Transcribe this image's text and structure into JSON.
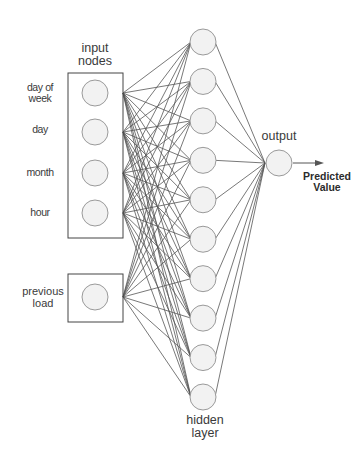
{
  "diagram": {
    "type": "neural-network",
    "labels": {
      "input_header": [
        "input",
        "nodes"
      ],
      "hidden_header": [
        "hidden",
        "layer"
      ],
      "output_header": "output",
      "prediction": [
        "Predicted",
        "Value"
      ]
    },
    "input_nodes": [
      {
        "label": [
          "day of",
          "week"
        ]
      },
      {
        "label": [
          "day"
        ]
      },
      {
        "label": [
          "month"
        ]
      },
      {
        "label": [
          "hour"
        ]
      }
    ],
    "extra_input": {
      "label": [
        "previous",
        "load"
      ]
    },
    "hidden_node_count": 10,
    "output_node_count": 1,
    "colors": {
      "line": "#555555",
      "node_stroke": "#9a9a9a",
      "node_fill": "#f2f2f2",
      "box_stroke": "#444444",
      "text": "#333333"
    }
  }
}
